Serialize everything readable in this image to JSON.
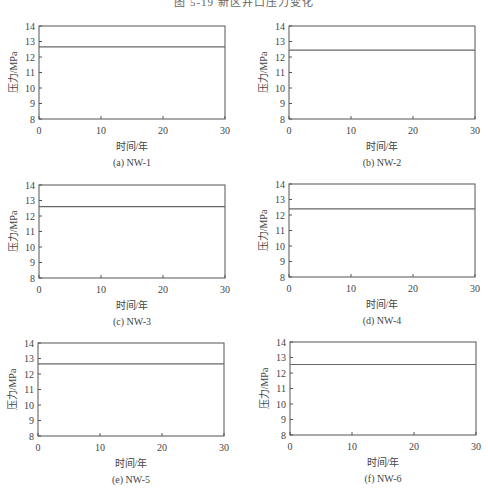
{
  "figure": {
    "caption_partial": "图 5-19  新区井口压力变化"
  },
  "chart_data": [
    {
      "type": "line",
      "id": "a",
      "caption": "(a) NW-1",
      "title": "",
      "xlabel": "时间/年",
      "ylabel": "压力/MPa",
      "xlim": [
        0,
        30
      ],
      "ylim": [
        8,
        14
      ],
      "xticks": [
        0,
        10,
        20,
        30
      ],
      "yticks": [
        8,
        9,
        10,
        11,
        12,
        13,
        14
      ],
      "grid": false,
      "series": [
        {
          "name": "NW-1",
          "x": [
            0,
            30
          ],
          "y": [
            12.65,
            12.65
          ]
        }
      ]
    },
    {
      "type": "line",
      "id": "b",
      "caption": "(b) NW-2",
      "title": "",
      "xlabel": "时间/年",
      "ylabel": "压力/MPa",
      "xlim": [
        0,
        30
      ],
      "ylim": [
        8,
        14
      ],
      "xticks": [
        0,
        10,
        20,
        30
      ],
      "yticks": [
        8,
        9,
        10,
        11,
        12,
        13,
        14
      ],
      "grid": false,
      "series": [
        {
          "name": "NW-2",
          "x": [
            0,
            30
          ],
          "y": [
            12.45,
            12.45
          ]
        }
      ]
    },
    {
      "type": "line",
      "id": "c",
      "caption": "(c) NW-3",
      "title": "",
      "xlabel": "时间/年",
      "ylabel": "压力/MPa",
      "xlim": [
        0,
        30
      ],
      "ylim": [
        8,
        14
      ],
      "xticks": [
        0,
        10,
        20,
        30
      ],
      "yticks": [
        8,
        9,
        10,
        11,
        12,
        13,
        14
      ],
      "grid": false,
      "series": [
        {
          "name": "NW-3",
          "x": [
            0,
            30
          ],
          "y": [
            12.6,
            12.6
          ]
        }
      ]
    },
    {
      "type": "line",
      "id": "d",
      "caption": "(d) NW-4",
      "title": "",
      "xlabel": "时间/年",
      "ylabel": "压力/MPa",
      "xlim": [
        0,
        30
      ],
      "ylim": [
        8,
        14
      ],
      "xticks": [
        0,
        10,
        20,
        30
      ],
      "yticks": [
        8,
        9,
        10,
        11,
        12,
        13,
        14
      ],
      "grid": false,
      "series": [
        {
          "name": "NW-4",
          "x": [
            0,
            30
          ],
          "y": [
            12.4,
            12.4
          ]
        }
      ]
    },
    {
      "type": "line",
      "id": "e",
      "caption": "(e) NW-5",
      "title": "",
      "xlabel": "时间/年",
      "ylabel": "压力/MPa",
      "xlim": [
        0,
        30
      ],
      "ylim": [
        8,
        14
      ],
      "xticks": [
        0,
        10,
        20,
        30
      ],
      "yticks": [
        8,
        9,
        10,
        11,
        12,
        13,
        14
      ],
      "grid": false,
      "series": [
        {
          "name": "NW-5",
          "x": [
            0,
            30
          ],
          "y": [
            12.65,
            12.65
          ]
        }
      ]
    },
    {
      "type": "line",
      "id": "f",
      "caption": "(f) NW-6",
      "title": "",
      "xlabel": "时间/年",
      "ylabel": "压力/MPa",
      "xlim": [
        0,
        30
      ],
      "ylim": [
        8,
        14
      ],
      "xticks": [
        0,
        10,
        20,
        30
      ],
      "yticks": [
        8,
        9,
        10,
        11,
        12,
        13,
        14
      ],
      "grid": false,
      "series": [
        {
          "name": "NW-6",
          "x": [
            0,
            30
          ],
          "y": [
            12.55,
            12.55
          ]
        }
      ]
    }
  ],
  "style": {
    "axis_color": "#555555",
    "line_color": "#666666",
    "text_color": "#444444"
  }
}
